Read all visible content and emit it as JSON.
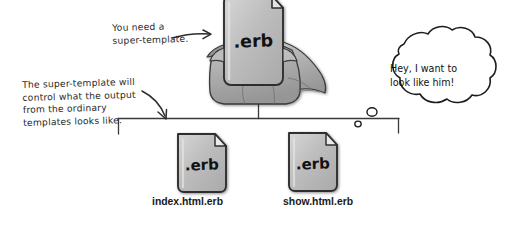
{
  "diagram": {
    "type": "hand-drawn concept diagram",
    "background_color": "#ffffff",
    "ink_color": "#2b2b2b",
    "document_fill": "#b9b9b9",
    "document_fill_light": "#d2d2d2",
    "document_shadow": "#8a8a8a"
  },
  "annotations": {
    "top": "You need a\nsuper-template.",
    "left": "The super-template will\ncontrol what the output\nfrom the ordinary\ntemplates looks like."
  },
  "thought_bubble": {
    "text": "Hey, I want to\nlook like him!",
    "speaker": "show.html.erb"
  },
  "nodes": {
    "parent": {
      "label": ".erb",
      "role": "super-template",
      "has_cape": true
    },
    "children": [
      {
        "label": ".erb",
        "caption": "index.html.erb"
      },
      {
        "label": ".erb",
        "caption": "show.html.erb"
      }
    ]
  }
}
